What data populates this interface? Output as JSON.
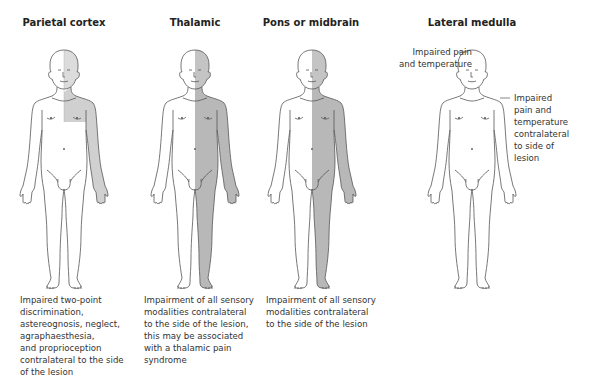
{
  "colors": {
    "outline": "#555555",
    "shade_dark": "#b8b8b8",
    "shade_light": "#d9d9d9",
    "background": "#ffffff"
  },
  "panels": [
    {
      "title": "Parietal cortex",
      "shading": "right half of face (light) + right arm and upper chest",
      "caption_lines": [
        "Impaired two-point",
        "discrimination,",
        "astereognosis, neglect,",
        "agraphaesthesia,",
        "and proprioception",
        "contralateral to the side",
        "of the lesion"
      ]
    },
    {
      "title": "Thalamic",
      "shading": "entire right half of body including face",
      "caption_lines": [
        "Impairment of all sensory",
        "modalities contralateral",
        "to the side of the lesion,",
        "this may be associated",
        "with a thalamic pain",
        "syndrome"
      ]
    },
    {
      "title": "Pons or midbrain",
      "shading": "entire right half of body including face",
      "caption_lines": [
        "Impairment of all sensory",
        "modalities contralateral",
        "to the side of the lesion"
      ]
    },
    {
      "title": "Lateral medulla",
      "shading": "none",
      "annotations": {
        "face": [
          "Impaired pain",
          "and temperature"
        ],
        "body": [
          "Impaired",
          "pain and",
          "temperature",
          "contralateral",
          "to side of",
          "lesion"
        ]
      }
    }
  ]
}
